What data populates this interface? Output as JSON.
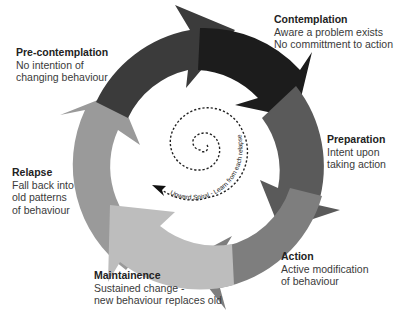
{
  "diagram": {
    "type": "cycle",
    "center": [
      200,
      158
    ],
    "stages": [
      {
        "id": "pre-contemplation",
        "title": "Pre-contemplation",
        "lines": [
          "No intention of",
          "changing behaviour"
        ],
        "color": "#3b3b3b"
      },
      {
        "id": "contemplation",
        "title": "Contemplation",
        "lines": [
          "Aware a problem exists",
          "No committment to action"
        ],
        "color": "#1c1c1c"
      },
      {
        "id": "preparation",
        "title": "Preparation",
        "lines": [
          "Intent upon",
          "taking action"
        ],
        "color": "#5a5a5a"
      },
      {
        "id": "action",
        "title": "Action",
        "lines": [
          "Active modification",
          "of behaviour"
        ],
        "color": "#7e7e7e"
      },
      {
        "id": "maintainence",
        "title": "Maintainence",
        "lines": [
          "Sustained change -",
          "new behaviour replaces old"
        ],
        "color": "#bdbdbd"
      },
      {
        "id": "relapse",
        "title": "Relapse",
        "lines": [
          "Fall back into",
          "old patterns",
          "of behaviour"
        ],
        "color": "#9a9a9a"
      }
    ],
    "spiral": {
      "label": "Upward Spiral - Learn from each relapse"
    },
    "caption": "· · ·"
  }
}
